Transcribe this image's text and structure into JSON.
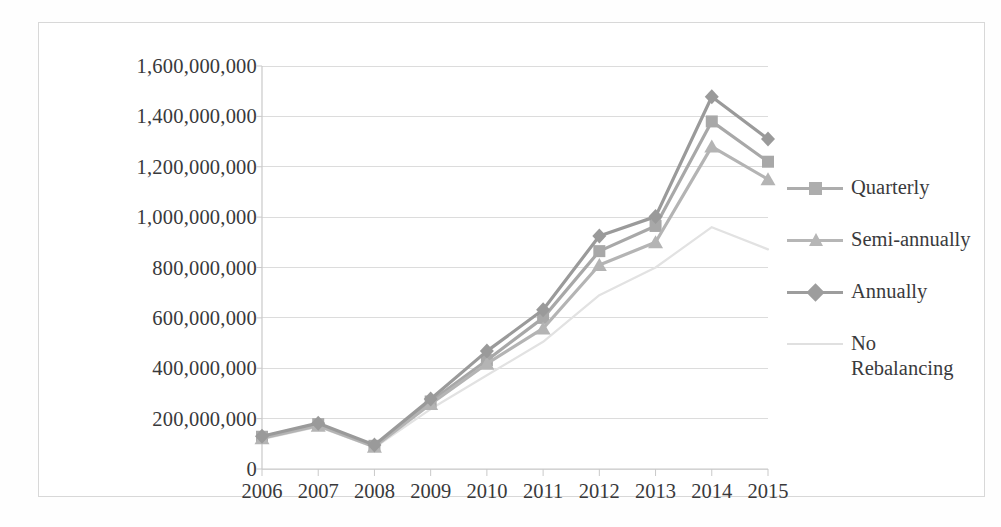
{
  "chart_data": {
    "type": "line",
    "title": "",
    "xlabel": "",
    "ylabel": "",
    "categories": [
      "2006",
      "2007",
      "2008",
      "2009",
      "2010",
      "2011",
      "2012",
      "2013",
      "2014",
      "2015"
    ],
    "x_tick_labels": [
      "2006",
      "2007",
      "2008",
      "2009",
      "2010",
      "2011",
      "2012",
      "2013",
      "2014",
      "2015"
    ],
    "y_tick_labels": [
      "1,600,000,000",
      "1,400,000,000",
      "1,200,000,000",
      "1,000,000,000",
      "800,000,000",
      "600,000,000",
      "400,000,000",
      "200,000,000",
      "0"
    ],
    "y_tick_values": [
      1600000000,
      1400000000,
      1200000000,
      1000000000,
      800000000,
      600000000,
      400000000,
      200000000,
      0
    ],
    "ylim": [
      0,
      1600000000
    ],
    "grid": true,
    "legend_position": "right",
    "series": [
      {
        "name": "Quarterly",
        "marker": "square",
        "color": "#a8a8a8",
        "values": [
          128000000,
          178000000,
          92000000,
          268000000,
          432000000,
          600000000,
          865000000,
          965000000,
          1380000000,
          1220000000
        ]
      },
      {
        "name": "Semi-annually",
        "marker": "triangle",
        "color": "#b4b4b4",
        "values": [
          122000000,
          172000000,
          88000000,
          258000000,
          418000000,
          558000000,
          810000000,
          900000000,
          1280000000,
          1150000000
        ]
      },
      {
        "name": "Annually",
        "marker": "diamond",
        "color": "#9a9a9a",
        "values": [
          130000000,
          182000000,
          95000000,
          278000000,
          468000000,
          632000000,
          925000000,
          1002000000,
          1478000000,
          1310000000
        ]
      },
      {
        "name": "No Rebalancing",
        "marker": "none",
        "color": "#e2e2e2",
        "values": [
          118000000,
          168000000,
          85000000,
          238000000,
          372000000,
          505000000,
          690000000,
          800000000,
          960000000,
          872000000
        ]
      }
    ]
  },
  "legend": {
    "items": [
      {
        "label": "Quarterly",
        "marker": "square-marker",
        "color": "#adadad"
      },
      {
        "label": "Semi-annually",
        "marker": "triangle-marker",
        "color": "#b6b6b6"
      },
      {
        "label": "Annually",
        "marker": "diamond-marker",
        "color": "#9d9d9d"
      },
      {
        "label": "No\nRebalancing",
        "marker": "line-marker",
        "color": "#e0e0e0"
      }
    ]
  },
  "colors": {
    "axis": "#c9c9c9",
    "grid": "#dcdcdc",
    "frame": "#d8d8d8",
    "text": "#39393b",
    "background": "#ffffff"
  }
}
